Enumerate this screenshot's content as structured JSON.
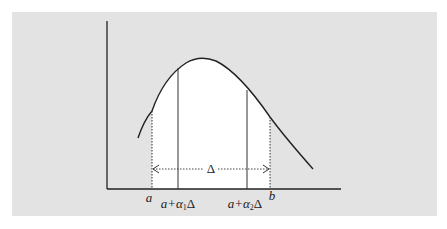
{
  "figure": {
    "background_color": "#e3e3e3",
    "fill_color": "#ffffff",
    "line_color": "#222222",
    "labels": {
      "a": "a",
      "b": "b",
      "point1_prefix": "a+α",
      "point1_sub": "1",
      "point1_suffix": "Δ",
      "point2_prefix": "a+α",
      "point2_sub": "2",
      "point2_suffix": "Δ",
      "interval": "Δ"
    }
  }
}
